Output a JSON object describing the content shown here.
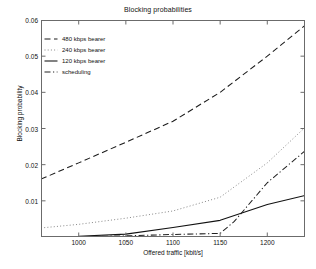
{
  "chart_data": {
    "type": "line",
    "title": "Blocking probabilities",
    "xlabel": "Offered traffic [kbit/s]",
    "ylabel": "Blocking probability",
    "xlim": [
      960,
      1240
    ],
    "ylim": [
      0,
      0.06
    ],
    "xticks": [
      1000,
      1050,
      1100,
      1150,
      1200
    ],
    "xticklabels": [
      "1000",
      "1050",
      "1100",
      "1150",
      "1200"
    ],
    "yticks": [
      0.01,
      0.02,
      0.03,
      0.04,
      0.05,
      0.06
    ],
    "yticklabels": [
      "0.01",
      "0.02",
      "0.03",
      "0.04",
      "0.05",
      "0.06"
    ],
    "grid": false,
    "legend_position": "upper-left",
    "series": [
      {
        "name": "480 kbps bearer",
        "style": "dashed",
        "color": "#1a1a1a",
        "x": [
          960,
          1000,
          1050,
          1100,
          1150,
          1200,
          1240
        ],
        "y": [
          0.016,
          0.0205,
          0.0262,
          0.032,
          0.04,
          0.05,
          0.0585
        ]
      },
      {
        "name": "240 kbps bearer",
        "style": "dotted",
        "color": "#7a7a7a",
        "x": [
          960,
          1000,
          1050,
          1100,
          1150,
          1200,
          1240
        ],
        "y": [
          0.0025,
          0.0035,
          0.0052,
          0.0072,
          0.011,
          0.0205,
          0.0303
        ]
      },
      {
        "name": "120 kbps bearer",
        "style": "solid",
        "color": "#111111",
        "x": [
          960,
          1000,
          1050,
          1100,
          1150,
          1200,
          1240
        ],
        "y": [
          0.0,
          0.0002,
          0.0008,
          0.0026,
          0.0046,
          0.009,
          0.0115
        ]
      },
      {
        "name": "scheduling",
        "style": "dash-dot",
        "color": "#222222",
        "x": [
          960,
          1000,
          1050,
          1100,
          1150,
          1165,
          1200,
          1240
        ],
        "y": [
          0.0,
          0.0001,
          0.0003,
          0.0007,
          0.001,
          0.0043,
          0.015,
          0.0238
        ]
      }
    ]
  },
  "legend": {
    "items": [
      {
        "label": "480 kbps bearer",
        "style": "dashed"
      },
      {
        "label": "240 kbps bearer",
        "style": "dotted"
      },
      {
        "label": "120 kbps bearer",
        "style": "solid"
      },
      {
        "label": "scheduling",
        "style": "dash-dot"
      }
    ]
  },
  "axes": {
    "frame_color": "#6b6b6b"
  }
}
